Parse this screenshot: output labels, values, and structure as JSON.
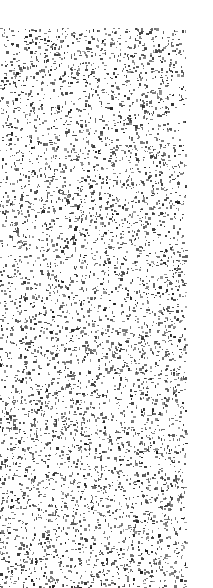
{
  "texture": {
    "type": "speckle-noise",
    "background_color": "#ffffff",
    "speck_color": "#2a2a2a",
    "region": {
      "x": 0,
      "y": 28,
      "width": 186,
      "height": 560
    },
    "density": 0.16,
    "seed": 1337
  }
}
